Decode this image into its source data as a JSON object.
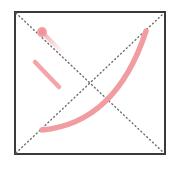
{
  "canvas": {
    "width": 177,
    "height": 169,
    "background_color": "#ffffff",
    "title": "sketch-canvas"
  },
  "frame": {
    "name": "square-border",
    "x": 14,
    "y": 11,
    "width": 152,
    "height": 144,
    "stroke_color": "#3a3a3a",
    "stroke_width": 2,
    "fill_color": "#ffffff"
  },
  "guides": {
    "stroke_color": "#6e6e6e",
    "stroke_width": 1.4,
    "dash_pattern": "1 3",
    "lines": [
      {
        "name": "diagonal-top-left-to-bottom-right",
        "x1": 15,
        "y1": 12,
        "x2": 165,
        "y2": 154
      },
      {
        "name": "diagonal-bottom-left-to-top-right",
        "x1": 15,
        "y1": 154,
        "x2": 165,
        "y2": 12
      }
    ],
    "intersection": {
      "x": 90,
      "y": 83
    }
  },
  "strokes": {
    "color": "#f09ca0",
    "color_soft": "#f4b4b7",
    "width": 5,
    "items": [
      {
        "name": "arc-stroke",
        "type": "quadratic-curve",
        "start": {
          "x": 42,
          "y": 130
        },
        "control": {
          "x": 116,
          "y": 123
        },
        "end": {
          "x": 146,
          "y": 31
        },
        "stroke_width": 5.5
      },
      {
        "name": "short-diagonal-stroke",
        "type": "line",
        "start": {
          "x": 35,
          "y": 62
        },
        "end": {
          "x": 59,
          "y": 87
        },
        "stroke_width": 4.5
      },
      {
        "name": "fading-trail-stroke",
        "type": "line",
        "start": {
          "x": 42,
          "y": 32
        },
        "end": {
          "x": 64,
          "y": 54
        },
        "stroke_width": 4
      }
    ],
    "blob": {
      "name": "pink-dot-blob",
      "cx": 42,
      "cy": 32,
      "r": 5,
      "fill_color": "#f2a2a6"
    }
  }
}
